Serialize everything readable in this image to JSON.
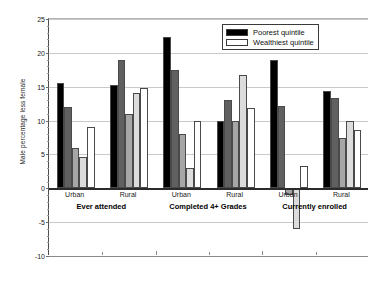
{
  "chart_data": {
    "type": "bar",
    "title": "",
    "xlabel": "",
    "ylabel": "Male percentage less female",
    "ylim": [
      -10,
      25
    ],
    "ytick_labels": [
      "25",
      "20",
      "15",
      "10",
      "5",
      "0",
      "-5",
      "-10"
    ],
    "ytick_values": [
      25,
      20,
      15,
      10,
      5,
      0,
      -5,
      -10
    ],
    "grid": true,
    "legend_position": "top-right",
    "categories": [
      "Urban / Ever attended",
      "Rural / Ever attended",
      "Urban / Completed 4+ Grades",
      "Rural / Completed 4+ Grades",
      "Urban / Currently enrolled",
      "Rural / Currently enrolled"
    ],
    "group_labels": [
      {
        "sub": "Urban",
        "main": "Ever attended"
      },
      {
        "sub": "Rural",
        "main": ""
      },
      {
        "sub": "Urban",
        "main": "Completed 4+ Grades"
      },
      {
        "sub": "Rural",
        "main": ""
      },
      {
        "sub": "Urban",
        "main": "Currently enrolled"
      },
      {
        "sub": "Rural",
        "main": ""
      }
    ],
    "series": [
      {
        "name": "Poorest quintile",
        "color": "#000000",
        "values": [
          15.5,
          15.3,
          22.3,
          10.0,
          19.0,
          14.3
        ]
      },
      {
        "name": "Second quintile",
        "color": "#606060",
        "values": [
          12.0,
          19.0,
          17.5,
          13.0,
          12.2,
          13.3
        ]
      },
      {
        "name": "Middle quintile",
        "color": "#a6a6a6",
        "values": [
          6.0,
          11.0,
          8.0,
          10.0,
          -1.0,
          7.5
        ]
      },
      {
        "name": "Fourth quintile",
        "color": "#dcdcdc",
        "values": [
          4.6,
          14.0,
          3.0,
          16.7,
          -6.0,
          10.0
        ]
      },
      {
        "name": "Wealthiest quintile",
        "color": "#ffffff",
        "values": [
          9.0,
          14.8,
          10.0,
          11.8,
          3.3,
          8.6
        ]
      }
    ]
  },
  "legend": {
    "entries": [
      {
        "label": "Poorest quintile",
        "color": "#000000"
      },
      {
        "label": "Wealthiest quintile",
        "color": "#ffffff"
      }
    ]
  }
}
